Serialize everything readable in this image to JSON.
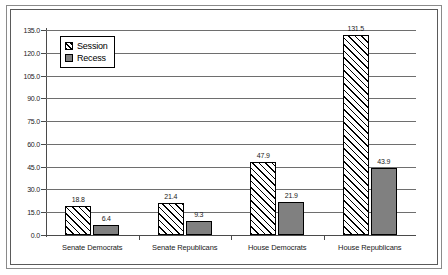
{
  "chart_data": {
    "type": "bar",
    "title": "",
    "xlabel": "",
    "ylabel": "",
    "ylim": [
      0.0,
      135.0
    ],
    "ytick_step": 15.0,
    "grid": true,
    "legend_position": "top-left-inside",
    "categories": [
      "Senate Democrats",
      "Senate Republicans",
      "House Democrats",
      "House Republicans"
    ],
    "ytick_labels": [
      "0.0",
      "15.0",
      "30.0",
      "45.0",
      "60.0",
      "75.0",
      "90.0",
      "105.0",
      "120.0",
      "135.0"
    ],
    "series": [
      {
        "name": "Session",
        "pattern": "diagonal-hatch",
        "color": "#ffffff",
        "values": [
          18.8,
          21.4,
          47.9,
          131.5
        ],
        "labels": [
          "18.8",
          "21.4",
          "47.9",
          "131.5"
        ]
      },
      {
        "name": "Recess",
        "pattern": "solid",
        "color": "#808080",
        "values": [
          6.4,
          9.3,
          21.9,
          43.9
        ],
        "labels": [
          "6.4",
          "9.3",
          "21.9",
          "43.9"
        ]
      }
    ]
  },
  "legend": {
    "items": [
      {
        "label": "Session"
      },
      {
        "label": "Recess"
      }
    ]
  }
}
